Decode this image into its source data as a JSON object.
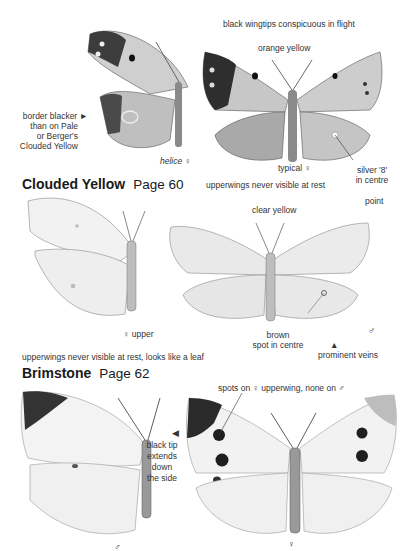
{
  "sections": [
    {
      "species": "Clouded Yellow",
      "page": "Page 60",
      "labels": {
        "wingtips": "black wingtips conspicuous in flight",
        "color": "orange yellow",
        "border_line1": "border blacker",
        "border_line2": "than on Pale",
        "border_line3": "or Berger's",
        "border_line4": "Clouded Yellow",
        "helice": "helice",
        "helice_sex": "♀",
        "typical": "typical ♀",
        "silver_line1": "silver '8'",
        "silver_line2": "in centre",
        "rest_note": "upperwings never visible at rest"
      }
    },
    {
      "species": "Brimstone",
      "page": "Page 62",
      "labels": {
        "color": "clear yellow",
        "point": "point",
        "upper": "♀ upper",
        "brown_line1": "brown",
        "brown_line2": "spot in centre",
        "male": "♂",
        "veins": "prominent veins",
        "rest_note": "upperwings never visible at rest, looks like a leaf"
      }
    },
    {
      "species": "Large White",
      "labels": {
        "spots": "spots on ♀ upperwing, none on ♂",
        "tip_line1": "black tip",
        "tip_line2": "extends",
        "tip_line3": "down",
        "tip_line4": "the side",
        "male": "♂",
        "female": "♀"
      }
    }
  ],
  "colors": {
    "ink": "#1a1a1a",
    "wing_dark": "#3a3a3a",
    "wing_mid": "#bdbdbd",
    "wing_light": "#e6e6e6"
  }
}
